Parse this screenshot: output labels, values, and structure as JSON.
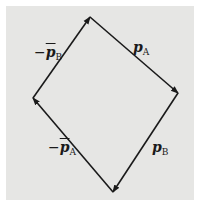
{
  "figure": {
    "background": "#e6e6e4",
    "stroke_color": "#1a1a1a",
    "vertices": {
      "top": [
        90,
        17
      ],
      "right": [
        178,
        93
      ],
      "bottom": [
        113,
        192
      ],
      "left": [
        33,
        98
      ]
    },
    "vectors": [
      {
        "id": "pA",
        "from": "top",
        "to": "right",
        "label": {
          "minus": "",
          "symbol": "p",
          "bar": false,
          "subscript": "A"
        }
      },
      {
        "id": "pB",
        "from": "right",
        "to": "bottom",
        "label": {
          "minus": "",
          "symbol": "p",
          "bar": false,
          "subscript": "B"
        }
      },
      {
        "id": "neg-pA-bar",
        "from": "bottom",
        "to": "left",
        "label": {
          "minus": "−",
          "symbol": "p",
          "bar": true,
          "subscript": "A"
        }
      },
      {
        "id": "neg-pB-bar",
        "from": "left",
        "to": "top",
        "label": {
          "minus": "−",
          "symbol": "p",
          "bar": true,
          "subscript": "B"
        }
      }
    ]
  }
}
